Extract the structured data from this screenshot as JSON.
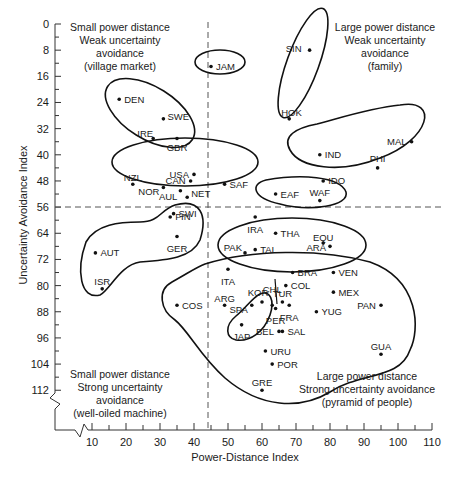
{
  "chart_data": {
    "type": "scatter",
    "title": "",
    "xlabel": "Power-Distance Index",
    "ylabel": "Uncertainty Avoidance Index",
    "xlim": [
      5,
      110
    ],
    "ylim": [
      0,
      116
    ],
    "y_inverted": true,
    "x_ticks": [
      10,
      20,
      30,
      40,
      50,
      60,
      70,
      80,
      90,
      100,
      110
    ],
    "y_ticks": [
      0,
      8,
      16,
      24,
      32,
      40,
      48,
      56,
      64,
      72,
      80,
      88,
      96,
      104,
      112
    ],
    "grid": false,
    "divider_lines": {
      "x": 44,
      "y": 56
    },
    "quadrant_labels": [
      {
        "position": "top-left",
        "lines": [
          "Small power distance",
          "Weak uncertainty",
          "avoidance",
          "(village market)"
        ]
      },
      {
        "position": "top-right",
        "lines": [
          "Large power distance",
          "Weak uncertainty",
          "avoidance",
          "(family)"
        ]
      },
      {
        "position": "bottom-left",
        "lines": [
          "Small power distance",
          "Strong uncertainty",
          "avoidance",
          "(well-oiled machine)"
        ]
      },
      {
        "position": "bottom-right",
        "lines": [
          "Large power distance",
          "Strong uncertainty avoidance",
          "(pyramid of people)"
        ]
      }
    ],
    "points": [
      {
        "label": "JAM",
        "x": 45,
        "y": 13
      },
      {
        "label": "SIN",
        "x": 74,
        "y": 8
      },
      {
        "label": "HOK",
        "x": 68,
        "y": 29
      },
      {
        "label": "DEN",
        "x": 18,
        "y": 23
      },
      {
        "label": "SWE",
        "x": 31,
        "y": 29
      },
      {
        "label": "IRE",
        "x": 28,
        "y": 35
      },
      {
        "label": "GBR",
        "x": 35,
        "y": 35
      },
      {
        "label": "MAL",
        "x": 104,
        "y": 36
      },
      {
        "label": "IND",
        "x": 77,
        "y": 40
      },
      {
        "label": "PHI",
        "x": 94,
        "y": 44
      },
      {
        "label": "IDO",
        "x": 78,
        "y": 48
      },
      {
        "label": "USA",
        "x": 40,
        "y": 46
      },
      {
        "label": "CAN",
        "x": 39,
        "y": 48
      },
      {
        "label": "NZL",
        "x": 22,
        "y": 49
      },
      {
        "label": "NOR",
        "x": 31,
        "y": 50
      },
      {
        "label": "AUL",
        "x": 36,
        "y": 51
      },
      {
        "label": "NET",
        "x": 38,
        "y": 53
      },
      {
        "label": "SAF",
        "x": 49,
        "y": 49
      },
      {
        "label": "EAF",
        "x": 64,
        "y": 52
      },
      {
        "label": "WAF",
        "x": 77,
        "y": 54
      },
      {
        "label": "SWI",
        "x": 34,
        "y": 58
      },
      {
        "label": "FIN",
        "x": 33,
        "y": 59
      },
      {
        "label": "GER",
        "x": 35,
        "y": 65
      },
      {
        "label": "AUT",
        "x": 11,
        "y": 70
      },
      {
        "label": "ISR",
        "x": 13,
        "y": 81
      },
      {
        "label": "IRA",
        "x": 58,
        "y": 59
      },
      {
        "label": "THA",
        "x": 64,
        "y": 64
      },
      {
        "label": "EQU",
        "x": 78,
        "y": 67
      },
      {
        "label": "PAK",
        "x": 55,
        "y": 70
      },
      {
        "label": "TAI",
        "x": 58,
        "y": 69
      },
      {
        "label": "ARA",
        "x": 80,
        "y": 68
      },
      {
        "label": "ITA",
        "x": 50,
        "y": 75
      },
      {
        "label": "BRA",
        "x": 69,
        "y": 76
      },
      {
        "label": "VEN",
        "x": 81,
        "y": 76
      },
      {
        "label": "CHL",
        "x": 63,
        "y": 86
      },
      {
        "label": "COL",
        "x": 67,
        "y": 80
      },
      {
        "label": "MEX",
        "x": 81,
        "y": 82
      },
      {
        "label": "ARG",
        "x": 49,
        "y": 86
      },
      {
        "label": "KOR",
        "x": 60,
        "y": 85
      },
      {
        "label": "TUR",
        "x": 66,
        "y": 85
      },
      {
        "label": "COS",
        "x": 35,
        "y": 86
      },
      {
        "label": "SPA",
        "x": 57,
        "y": 86
      },
      {
        "label": "FRA",
        "x": 68,
        "y": 86
      },
      {
        "label": "PAN",
        "x": 95,
        "y": 86
      },
      {
        "label": "PER",
        "x": 64,
        "y": 87
      },
      {
        "label": "YUG",
        "x": 76,
        "y": 88
      },
      {
        "label": "JAP",
        "x": 54,
        "y": 92
      },
      {
        "label": "BEL",
        "x": 65,
        "y": 94
      },
      {
        "label": "SAL",
        "x": 66,
        "y": 94
      },
      {
        "label": "GUA",
        "x": 95,
        "y": 101
      },
      {
        "label": "URU",
        "x": 61,
        "y": 100
      },
      {
        "label": "POR",
        "x": 63,
        "y": 104
      },
      {
        "label": "GRE",
        "x": 60,
        "y": 112
      }
    ],
    "clusters": [
      [
        "JAM"
      ],
      [
        "SIN",
        "HOK"
      ],
      [
        "DEN",
        "SWE",
        "IRE",
        "GBR"
      ],
      [
        "MAL",
        "IND",
        "PHI",
        "IDO"
      ],
      [
        "USA",
        "CAN",
        "NZL",
        "NOR",
        "AUL",
        "NET",
        "SAF"
      ],
      [
        "EAF",
        "WAF"
      ],
      [
        "SWI",
        "FIN",
        "GER",
        "AUT",
        "ISR"
      ],
      [
        "IRA",
        "THA",
        "EQU",
        "PAK",
        "TAI",
        "ARA"
      ],
      [
        "KOR",
        "JAP"
      ],
      [
        "ITA",
        "BRA",
        "VEN",
        "CHL",
        "COL",
        "MEX",
        "ARG",
        "TUR",
        "COS",
        "SPA",
        "FRA",
        "PAN",
        "PER",
        "YUG",
        "BEL",
        "SAL",
        "GUA",
        "URU",
        "POR",
        "GRE"
      ]
    ]
  }
}
